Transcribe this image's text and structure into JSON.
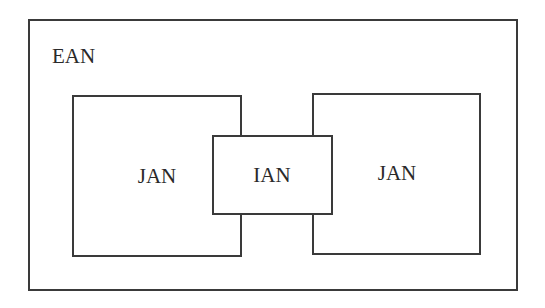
{
  "diagram": {
    "type": "nested-sets",
    "line_color": "#3a3a3a",
    "text_color": "#2a2a2a",
    "outer": {
      "label": "EAN"
    },
    "left_set": {
      "label": "JAN"
    },
    "right_set": {
      "label": "JAN"
    },
    "intersection": {
      "label": "IAN"
    }
  }
}
